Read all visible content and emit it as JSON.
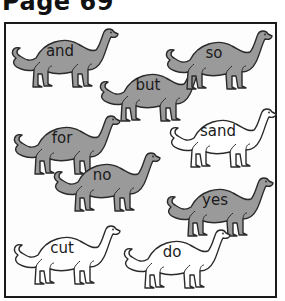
{
  "page": {
    "title": "Page 69"
  },
  "colors": {
    "grey_fill": "#9a9a9a",
    "white_fill": "#ffffff",
    "outline": "#2a2a2a"
  },
  "dinosaurs": [
    {
      "word": "and",
      "fill": "grey",
      "x": 8,
      "y": 28
    },
    {
      "word": "but",
      "fill": "grey",
      "x": 96,
      "y": 62
    },
    {
      "word": "so",
      "fill": "grey",
      "x": 162,
      "y": 30
    },
    {
      "word": "for",
      "fill": "grey",
      "x": 10,
      "y": 115
    },
    {
      "word": "no",
      "fill": "grey",
      "x": 50,
      "y": 152
    },
    {
      "word": "sand",
      "fill": "white",
      "x": 166,
      "y": 108
    },
    {
      "word": "yes",
      "fill": "grey",
      "x": 163,
      "y": 177
    },
    {
      "word": "cut",
      "fill": "white",
      "x": 10,
      "y": 225
    },
    {
      "word": "do",
      "fill": "white",
      "x": 120,
      "y": 229
    }
  ]
}
